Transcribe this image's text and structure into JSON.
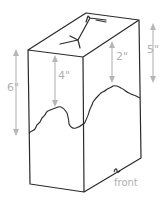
{
  "diagram": {
    "colors": {
      "outline": "#2a2a2a",
      "dimension": "#b5b5b5",
      "label": "#b0b0b0",
      "background": "#ffffff"
    },
    "dimensions": [
      {
        "id": "left-height",
        "label": "6\""
      },
      {
        "id": "front-cut-height",
        "label": "4\""
      },
      {
        "id": "side-cut-height",
        "label": "2\""
      },
      {
        "id": "right-height",
        "label": "5\""
      }
    ],
    "annotations": {
      "front_label": "front"
    }
  }
}
